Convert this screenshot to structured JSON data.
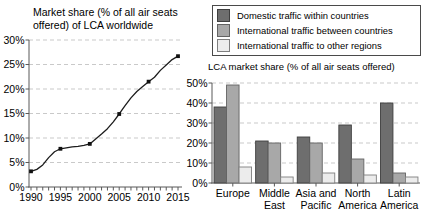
{
  "figure": {
    "background": "#ffffff",
    "text_color": "#000000",
    "axis_color": "#595959",
    "grid_color": "#c9c9c9"
  },
  "chart_data": [
    {
      "type": "line",
      "title": "Market share (% of all air seats offered) of LCA worldwide",
      "x": [
        1990,
        1991,
        1992,
        1993,
        1994,
        1995,
        1996,
        1997,
        1998,
        1999,
        2000,
        2001,
        2002,
        2003,
        2004,
        2005,
        2006,
        2007,
        2008,
        2009,
        2010,
        2011,
        2012,
        2013,
        2014,
        2015
      ],
      "values": [
        3.2,
        3.6,
        4.5,
        6.0,
        7.2,
        7.8,
        8.0,
        8.2,
        8.3,
        8.5,
        8.8,
        9.8,
        10.8,
        11.9,
        13.3,
        14.9,
        16.6,
        18.2,
        19.5,
        20.5,
        21.5,
        22.4,
        23.8,
        24.9,
        26.0,
        26.7
      ],
      "marker_x": [
        1990,
        1995,
        2000,
        2005,
        2010,
        2015
      ],
      "xticks": [
        1990,
        1995,
        2000,
        2005,
        2010,
        2015
      ],
      "yticks": [
        0,
        5,
        10,
        15,
        20,
        25,
        30
      ],
      "ytick_suffix": "%",
      "xlim": [
        1990,
        2015
      ],
      "ylim": [
        0,
        30
      ],
      "grid": "horizontal-dashed",
      "line_color": "#1c1c1c",
      "marker": "filled-square"
    },
    {
      "type": "bar",
      "title": "LCA market share (% of all air seats offered)",
      "categories": [
        "Europe",
        "Middle East",
        "Asia and Pacific",
        "North America",
        "Latin America"
      ],
      "series": [
        {
          "name": "Domestic traffic within countries",
          "color": "#6e6e6e",
          "border": "#3f3f3f",
          "values": [
            38,
            21,
            23,
            29,
            40
          ]
        },
        {
          "name": "International traffic between countries",
          "color": "#a8a8a8",
          "border": "#636363",
          "values": [
            49,
            20,
            20,
            12,
            5
          ]
        },
        {
          "name": "International traffic to other regions",
          "color": "#ececec",
          "border": "#7f7f7f",
          "values": [
            8,
            3,
            5,
            4,
            3
          ]
        }
      ],
      "yticks": [
        0,
        10,
        20,
        30,
        40,
        50
      ],
      "ytick_suffix": "%",
      "ylim": [
        0,
        50
      ],
      "grid": "horizontal-dashed",
      "legend_position": "top-right"
    }
  ]
}
